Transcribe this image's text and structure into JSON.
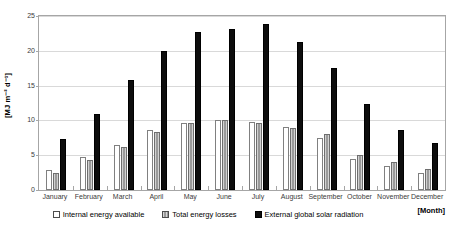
{
  "chart_data": {
    "type": "bar",
    "title": "",
    "xlabel": "[Month]",
    "ylabel": "[MJ m⁻² d⁻¹]",
    "ylim": [
      0,
      25
    ],
    "yticks": [
      0,
      5,
      10,
      15,
      20,
      25
    ],
    "grid": true,
    "legend_position": "bottom",
    "categories": [
      "January",
      "February",
      "March",
      "April",
      "May",
      "June",
      "July",
      "August",
      "September",
      "October",
      "November",
      "December"
    ],
    "series": [
      {
        "name": "Internal energy available",
        "color": "#ffffff",
        "values": [
          2.9,
          4.7,
          6.5,
          8.6,
          9.7,
          10.0,
          9.8,
          9.0,
          7.5,
          4.5,
          3.5,
          2.5
        ]
      },
      {
        "name": "Total energy losses",
        "color": "#9a9a9a",
        "values": [
          2.4,
          4.3,
          6.2,
          8.3,
          9.6,
          10.0,
          9.7,
          8.9,
          8.0,
          5.0,
          4.0,
          3.0
        ]
      },
      {
        "name": "External global solar radiation",
        "color": "#0d0d0d",
        "values": [
          7.4,
          10.9,
          15.8,
          20.0,
          22.7,
          23.2,
          23.8,
          21.2,
          17.5,
          12.4,
          8.6,
          6.7
        ]
      }
    ]
  },
  "axes": {
    "ytick_labels": [
      "0",
      "5",
      "10",
      "15",
      "20",
      "25"
    ]
  }
}
